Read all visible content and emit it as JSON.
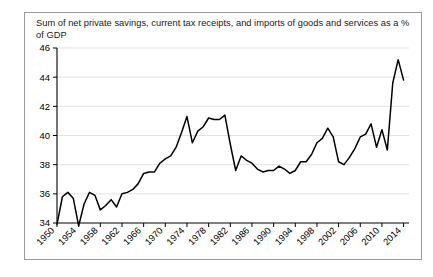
{
  "chart_data": {
    "type": "line",
    "title": "Sum of net private savings, current tax receipts, and imports of goods and services as a % of GDP",
    "xlabel": "",
    "ylabel": "",
    "ylim": [
      34,
      46
    ],
    "xlim": [
      1950,
      2015
    ],
    "grid": true,
    "legend": "none",
    "line_color": "#000000",
    "y_ticks": [
      34,
      36,
      38,
      40,
      42,
      44,
      46
    ],
    "x_ticks": [
      1950,
      1954,
      1958,
      1962,
      1966,
      1970,
      1974,
      1978,
      1982,
      1986,
      1990,
      1994,
      1998,
      2002,
      2006,
      2010,
      2014
    ],
    "x": [
      1950,
      1951,
      1952,
      1953,
      1954,
      1955,
      1956,
      1957,
      1958,
      1959,
      1960,
      1961,
      1962,
      1963,
      1964,
      1965,
      1966,
      1967,
      1968,
      1969,
      1970,
      1971,
      1972,
      1973,
      1974,
      1975,
      1976,
      1977,
      1978,
      1979,
      1980,
      1981,
      1982,
      1983,
      1984,
      1985,
      1986,
      1987,
      1988,
      1989,
      1990,
      1991,
      1992,
      1993,
      1994,
      1995,
      1996,
      1997,
      1998,
      1999,
      2000,
      2001,
      2002,
      2003,
      2004,
      2005,
      2006,
      2007,
      2008,
      2009,
      2010,
      2011,
      2012,
      2013,
      2014
    ],
    "values": [
      33.9,
      35.8,
      36.1,
      35.7,
      33.8,
      35.3,
      36.1,
      35.9,
      34.9,
      35.2,
      35.6,
      35.1,
      36.0,
      36.1,
      36.3,
      36.7,
      37.4,
      37.5,
      37.5,
      38.1,
      38.4,
      38.6,
      39.2,
      40.2,
      41.3,
      39.5,
      40.3,
      40.6,
      41.2,
      41.1,
      41.1,
      41.4,
      39.4,
      37.6,
      38.6,
      38.3,
      38.1,
      37.7,
      37.5,
      37.6,
      37.6,
      37.9,
      37.7,
      37.4,
      37.6,
      38.2,
      38.2,
      38.7,
      39.5,
      39.8,
      40.5,
      39.9,
      38.2,
      38.0,
      38.5,
      39.1,
      39.9,
      40.1,
      40.8,
      39.2,
      40.4,
      39.0,
      43.6,
      45.2,
      43.8
    ],
    "series_name": "Sum of net private savings, current tax receipts, and imports as % of GDP"
  },
  "title_text": "Sum of net private savings, current tax receipts, and imports of goods and services as a % of GDP"
}
